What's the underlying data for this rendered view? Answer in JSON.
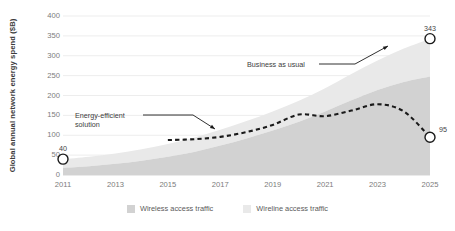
{
  "chart_data": {
    "type": "area",
    "title": "",
    "subtitle": "",
    "xlabel": "",
    "ylabel": "Global annual network energy spend ($B)",
    "xlim": [
      2011,
      2025
    ],
    "ylim": [
      0,
      400
    ],
    "ytick_step": 50,
    "yticks": [
      "400",
      "350",
      "300",
      "250",
      "200",
      "150",
      "100",
      "50",
      "0"
    ],
    "xticks": [
      "2011",
      "2013",
      "2015",
      "2017",
      "2019",
      "2021",
      "2023",
      "2025"
    ],
    "x": [
      2011,
      2012,
      2013,
      2014,
      2015,
      2016,
      2017,
      2018,
      2019,
      2020,
      2021,
      2022,
      2023,
      2024,
      2025
    ],
    "grid": "horizontal",
    "legend_position": "bottom-center",
    "stacked": true,
    "series": [
      {
        "name": "Wireless access traffic",
        "color": "#d2d2d2",
        "values": [
          18,
          22,
          28,
          36,
          46,
          58,
          74,
          92,
          112,
          134,
          160,
          188,
          214,
          234,
          248
        ]
      },
      {
        "name": "Wireline access traffic",
        "color": "#e9e9e9",
        "values": [
          22,
          24,
          26,
          29,
          32,
          36,
          40,
          44,
          48,
          53,
          58,
          66,
          74,
          84,
          95
        ]
      }
    ],
    "total_series": {
      "name": "Business as usual",
      "values": [
        40,
        46,
        54,
        65,
        78,
        94,
        114,
        136,
        160,
        187,
        218,
        254,
        288,
        318,
        343
      ]
    },
    "line_series": {
      "name": "Energy-efficient solution",
      "color": "#1a1a1a",
      "style": "dashed",
      "values": [
        null,
        null,
        null,
        null,
        88,
        90,
        96,
        108,
        126,
        152,
        148,
        162,
        178,
        160,
        95
      ]
    },
    "annotations": [
      {
        "id": "bau",
        "text": "Business as usual",
        "target": "total-area-edge"
      },
      {
        "id": "eff",
        "text": "Energy-efficient\nsolution",
        "target": "dashed-line"
      }
    ],
    "markers": [
      {
        "id": "start",
        "label": "40",
        "x": 2011,
        "y": 40
      },
      {
        "id": "bau-end",
        "label": "343",
        "x": 2025,
        "y": 343
      },
      {
        "id": "eff-end",
        "label": "95",
        "x": 2025,
        "y": 95
      }
    ]
  }
}
